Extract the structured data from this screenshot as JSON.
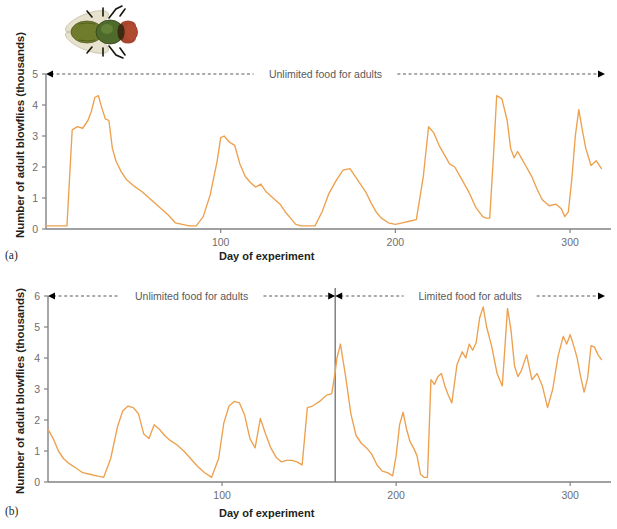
{
  "figure": {
    "line_color": "#eda04e",
    "axis_color": "#808285",
    "text_color": "#231f20",
    "tick_color": "#6d6e71",
    "annotation_color": "#58595b",
    "divider_color": "#6d6e71"
  },
  "fly_photo": {
    "alt": "Photograph of an adult blowfly, dorsal view",
    "wing_color": "#ded8bc",
    "thorax_color": "#6d7a2e",
    "abdomen_color": "#5e7c32",
    "head_color": "#9e3b24",
    "eye_color": "#a8402a",
    "leg_color": "#1a1a1a"
  },
  "panel_a": {
    "letter": "(a)",
    "ylabel": "Number of adult blowflies (thousands)",
    "xlabel": "Day of experiment",
    "annotation": "Unlimited food for adults",
    "y_ticks": [
      "0",
      "1",
      "2",
      "3",
      "4",
      "5"
    ],
    "x_ticks": [
      "100",
      "200",
      "300"
    ]
  },
  "panel_b": {
    "letter": "(b)",
    "ylabel": "Number of adult blowflies (thousands)",
    "xlabel": "Day of experiment",
    "annotation_left": "Unlimited food for adults",
    "annotation_right": "Limited food for adults",
    "y_ticks": [
      "0",
      "1",
      "2",
      "3",
      "4",
      "5",
      "6"
    ],
    "x_ticks": [
      "100",
      "200",
      "300"
    ]
  },
  "chart_data": [
    {
      "type": "line",
      "id": "panel-a",
      "title": "(a) Blowfly population with unlimited food for adults",
      "xlabel": "Day of experiment",
      "ylabel": "Number of adult blowflies (thousands)",
      "xlim": [
        0,
        320
      ],
      "ylim": [
        0,
        5
      ],
      "x_ticks": [
        100,
        200,
        300
      ],
      "y_ticks": [
        0,
        1,
        2,
        3,
        4,
        5
      ],
      "grid": false,
      "legend": "none",
      "annotations": [
        {
          "text": "Unlimited food for adults",
          "x_start": 0,
          "x_end": 320,
          "y": 5,
          "style": "dashed double arrow"
        }
      ],
      "series": [
        {
          "name": "Adult blowflies",
          "color": "#eda04e",
          "x": [
            0,
            4,
            8,
            12,
            15,
            18,
            21,
            24,
            26,
            28,
            30,
            32,
            34,
            36,
            38,
            40,
            43,
            46,
            50,
            55,
            60,
            65,
            70,
            74,
            78,
            82,
            86,
            90,
            94,
            98,
            100,
            102,
            105,
            108,
            111,
            114,
            117,
            120,
            123,
            126,
            130,
            134,
            137,
            140,
            143,
            146,
            150,
            154,
            158,
            162,
            166,
            170,
            174,
            177,
            180,
            183,
            186,
            189,
            192,
            196,
            200,
            204,
            208,
            212,
            216,
            219,
            222,
            225,
            228,
            231,
            234,
            238,
            242,
            246,
            250,
            252,
            254,
            256,
            258,
            261,
            264,
            266,
            268,
            270,
            272,
            275,
            278,
            281,
            284,
            288,
            292,
            295,
            297,
            299,
            301,
            303,
            305,
            307,
            309,
            312,
            315,
            318
          ],
          "y": [
            0.1,
            0.1,
            0.1,
            0.1,
            3.2,
            3.3,
            3.25,
            3.5,
            3.8,
            4.25,
            4.3,
            3.9,
            3.55,
            3.5,
            2.6,
            2.2,
            1.85,
            1.6,
            1.4,
            1.2,
            0.95,
            0.7,
            0.45,
            0.2,
            0.15,
            0.1,
            0.1,
            0.4,
            1.1,
            2.2,
            2.95,
            3.0,
            2.8,
            2.7,
            2.1,
            1.7,
            1.5,
            1.35,
            1.45,
            1.2,
            1.0,
            0.8,
            0.55,
            0.35,
            0.15,
            0.1,
            0.1,
            0.1,
            0.55,
            1.15,
            1.55,
            1.9,
            1.95,
            1.7,
            1.45,
            1.2,
            0.85,
            0.55,
            0.35,
            0.2,
            0.15,
            0.2,
            0.25,
            0.3,
            1.7,
            3.3,
            3.1,
            2.7,
            2.4,
            2.1,
            2.0,
            1.6,
            1.2,
            0.7,
            0.4,
            0.35,
            0.35,
            2.2,
            4.3,
            4.2,
            3.5,
            2.6,
            2.3,
            2.5,
            2.3,
            2.0,
            1.7,
            1.3,
            0.95,
            0.75,
            0.8,
            0.65,
            0.4,
            0.55,
            1.6,
            3.0,
            3.85,
            3.2,
            2.6,
            2.05,
            2.2,
            1.95,
            1.75,
            1.65
          ]
        }
      ]
    },
    {
      "type": "line",
      "id": "panel-b",
      "title": "(b) Blowfly population: unlimited then limited food for adults",
      "xlabel": "Day of experiment",
      "ylabel": "Number of adult blowflies (thousands)",
      "xlim": [
        0,
        320
      ],
      "ylim": [
        0,
        6
      ],
      "x_ticks": [
        100,
        200,
        300
      ],
      "y_ticks": [
        0,
        1,
        2,
        3,
        4,
        5,
        6
      ],
      "grid": false,
      "legend": "none",
      "divider_x": 165,
      "annotations": [
        {
          "text": "Unlimited food for adults",
          "x_start": 0,
          "x_end": 165,
          "y": 6,
          "style": "dashed double arrow"
        },
        {
          "text": "Limited food for adults",
          "x_start": 165,
          "x_end": 320,
          "y": 6,
          "style": "dashed double arrow"
        }
      ],
      "series": [
        {
          "name": "Adult blowflies",
          "color": "#eda04e",
          "x": [
            0,
            3,
            6,
            9,
            12,
            16,
            20,
            24,
            28,
            32,
            36,
            40,
            43,
            46,
            49,
            52,
            55,
            58,
            61,
            64,
            67,
            70,
            74,
            78,
            82,
            86,
            90,
            94,
            98,
            101,
            104,
            107,
            110,
            113,
            116,
            119,
            122,
            125,
            128,
            131,
            134,
            137,
            140,
            143,
            146,
            149,
            152,
            156,
            160,
            163,
            165,
            166,
            168,
            171,
            174,
            177,
            180,
            183,
            186,
            189,
            192,
            195,
            198,
            200,
            202,
            204,
            206,
            208,
            210,
            212,
            214,
            216,
            218,
            220,
            222,
            224,
            226,
            228,
            230,
            232,
            235,
            238,
            240,
            242,
            244,
            246,
            248,
            250,
            252,
            255,
            258,
            261,
            264,
            266,
            268,
            270,
            272,
            275,
            278,
            281,
            284,
            287,
            290,
            293,
            296,
            298,
            300,
            302,
            304,
            306,
            308,
            310,
            312,
            314,
            316,
            318
          ],
          "y": [
            1.7,
            1.4,
            1.0,
            0.75,
            0.6,
            0.45,
            0.3,
            0.25,
            0.2,
            0.15,
            0.75,
            1.8,
            2.3,
            2.45,
            2.4,
            2.2,
            1.55,
            1.4,
            1.85,
            1.7,
            1.5,
            1.35,
            1.2,
            1.0,
            0.75,
            0.5,
            0.3,
            0.15,
            0.75,
            1.9,
            2.45,
            2.6,
            2.55,
            2.15,
            1.4,
            1.1,
            2.05,
            1.55,
            1.1,
            0.8,
            0.65,
            0.7,
            0.7,
            0.65,
            0.55,
            2.4,
            2.45,
            2.6,
            2.8,
            2.85,
            3.55,
            4.0,
            4.45,
            3.4,
            2.2,
            1.5,
            1.25,
            1.1,
            0.9,
            0.55,
            0.35,
            0.3,
            0.2,
            0.85,
            1.85,
            2.25,
            1.7,
            1.3,
            1.1,
            0.85,
            0.25,
            0.15,
            0.15,
            3.3,
            3.15,
            3.4,
            3.5,
            3.1,
            2.8,
            2.55,
            3.8,
            4.2,
            4.0,
            4.45,
            4.25,
            4.5,
            5.3,
            5.65,
            5.0,
            4.35,
            3.5,
            3.1,
            5.6,
            4.9,
            3.75,
            3.4,
            3.6,
            4.1,
            3.3,
            3.5,
            3.1,
            2.4,
            3.0,
            4.05,
            4.7,
            4.45,
            4.75,
            4.4,
            4.0,
            3.4,
            2.9,
            3.35,
            4.4,
            4.35,
            4.1,
            3.95,
            4.2,
            4.45,
            3.95,
            4.3,
            4.7,
            5.1,
            4.35,
            4.75,
            4.25,
            4.65,
            4.45
          ]
        }
      ]
    }
  ]
}
